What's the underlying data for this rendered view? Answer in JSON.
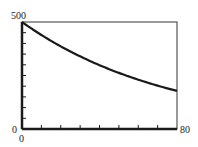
{
  "chart_data": {
    "type": "line",
    "title": "",
    "xlabel": "",
    "ylabel": "",
    "xlim": [
      0,
      80
    ],
    "ylim": [
      0,
      500
    ],
    "x_tick_step": 10,
    "y_tick_step": 50,
    "tick_labels": {
      "y_top": "500",
      "y_bottom": "0",
      "x_left": "0",
      "x_right": "80"
    },
    "grid": false,
    "legend": null,
    "series": [
      {
        "name": "decay curve",
        "x": [
          0,
          10,
          20,
          30,
          40,
          50,
          60,
          70,
          80
        ],
        "values": [
          500,
          440,
          387,
          340,
          298,
          262,
          231,
          203,
          178
        ]
      }
    ],
    "colors": {
      "line": "#1a1a1a",
      "axis": "#1a1a1a"
    }
  }
}
